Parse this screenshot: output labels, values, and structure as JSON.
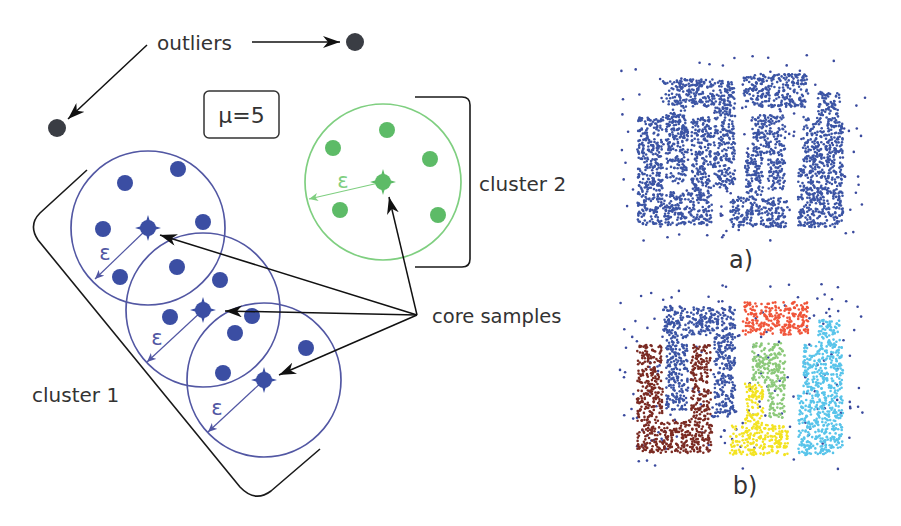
{
  "labels": {
    "outliers": "outliers",
    "mu": "μ=5",
    "cluster1": "cluster 1",
    "cluster2": "cluster 2",
    "core_samples": "core samples",
    "epsilon": "ε",
    "panel_a": "a)",
    "panel_b": "b)"
  },
  "colors": {
    "text": "#333333",
    "arrow": "#111111",
    "outlier": "#3a3d44",
    "cluster1_fill": "#3b4ea3",
    "cluster1_stroke": "#5257a3",
    "cluster2_fill": "#5dbb67",
    "cluster2_stroke": "#7fcf80",
    "noise": "#3a4a9e"
  },
  "diagram": {
    "outlier_points": [
      {
        "x": 355,
        "y": 42
      },
      {
        "x": 57,
        "y": 128
      }
    ],
    "outlier_arrows": [
      {
        "from": [
          252,
          42
        ],
        "to": [
          340,
          42
        ]
      },
      {
        "from": [
          147,
          45
        ],
        "to": [
          68,
          119
        ]
      }
    ],
    "clusters": [
      {
        "name": "cluster-1",
        "fill": "#3b4ea3",
        "stroke": "#5257a3",
        "radius": 77,
        "neighborhoods": [
          {
            "core": [
              148,
              228
            ],
            "eps_end": [
              95,
              279
            ],
            "eps_label": [
              105,
              260
            ],
            "members": [
              [
                125,
                183
              ],
              [
                178,
                169
              ],
              [
                103,
                229
              ],
              [
                203,
                222
              ],
              [
                120,
                277
              ],
              [
                177,
                267
              ]
            ]
          },
          {
            "core": [
              203,
              310
            ],
            "eps_end": [
              147,
              362
            ],
            "eps_label": [
              157,
              345
            ],
            "members": [
              [
                220,
                280
              ],
              [
                170,
                317
              ],
              [
                252,
                316
              ],
              [
                235,
                333
              ],
              [
                223,
                373
              ]
            ]
          },
          {
            "core": [
              264,
              380
            ],
            "eps_end": [
              208,
              432
            ],
            "eps_label": [
              217,
              415
            ],
            "members": [
              [
                306,
                348
              ]
            ]
          }
        ]
      },
      {
        "name": "cluster-2",
        "fill": "#5dbb67",
        "stroke": "#7fcf80",
        "radius": 78,
        "neighborhoods": [
          {
            "core": [
              383,
              182
            ],
            "eps_end": [
              309,
              199
            ],
            "eps_label": [
              343,
              188
            ],
            "members": [
              [
                387,
                130
              ],
              [
                333,
                148
              ],
              [
                430,
                159
              ],
              [
                340,
                210
              ],
              [
                438,
                215
              ]
            ]
          }
        ]
      }
    ],
    "core_arrows": {
      "hub": [
        417,
        315
      ],
      "targets": [
        [
          160,
          235
        ],
        [
          225,
          311
        ],
        [
          279,
          375
        ],
        [
          389,
          197
        ]
      ]
    },
    "brackets": {
      "cluster1": "M87,170 L40,213 Q28,225 38,240 L240,487 Q255,503 271,491 L320,449",
      "cluster2": "M415,97 L462,97 Q470,97 470,105 L470,259 Q470,267 462,267 L415,267"
    },
    "mu_box": {
      "x": 204,
      "y": 91,
      "w": 75,
      "h": 47
    }
  },
  "scatter": {
    "density": 0.12,
    "point_radius": 1.3,
    "shapes": [
      {
        "name": "blue-arch",
        "color": "#3b54a4",
        "rects": [
          [
            663,
            307,
            72,
            28
          ],
          [
            666,
            335,
            22,
            75
          ],
          [
            713,
            335,
            22,
            82
          ]
        ]
      },
      {
        "name": "brown-u",
        "color": "#7a2a22",
        "rects": [
          [
            637,
            345,
            26,
            75
          ],
          [
            691,
            345,
            20,
            75
          ],
          [
            637,
            420,
            75,
            33
          ]
        ]
      },
      {
        "name": "orange-bar",
        "color": "#f0553a",
        "rects": [
          [
            743,
            302,
            65,
            33
          ]
        ]
      },
      {
        "name": "green-hook",
        "color": "#8cc97a",
        "rects": [
          [
            752,
            343,
            33,
            22
          ],
          [
            768,
            365,
            17,
            53
          ],
          [
            752,
            365,
            16,
            18
          ]
        ]
      },
      {
        "name": "yellow-t",
        "color": "#f3e321",
        "rects": [
          [
            745,
            383,
            18,
            42
          ],
          [
            730,
            425,
            58,
            30
          ]
        ]
      },
      {
        "name": "cyan-blob",
        "color": "#58c4ea",
        "rects": [
          [
            818,
            320,
            22,
            25
          ],
          [
            803,
            345,
            40,
            50
          ],
          [
            798,
            395,
            45,
            60
          ]
        ]
      }
    ],
    "noise": {
      "count": 170,
      "box": [
        620,
        283,
        245,
        187
      ],
      "color": "#3a4a9e"
    },
    "panels": [
      {
        "id": "a",
        "dy": -228,
        "monochrome": "#3b54a4",
        "seed": 1234
      },
      {
        "id": "b",
        "dy": 0,
        "monochrome": null,
        "seed": 98765
      }
    ]
  }
}
